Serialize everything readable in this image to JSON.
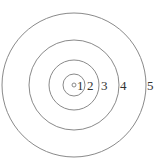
{
  "diagram": {
    "type": "concentric-circles",
    "center": [
      74,
      85
    ],
    "rings": [
      {
        "id": "1",
        "radius": 2
      },
      {
        "id": "2",
        "radius": 11
      },
      {
        "id": "3",
        "radius": 25
      },
      {
        "id": "4",
        "radius": 45
      },
      {
        "id": "5",
        "radius": 72
      }
    ],
    "labels": [
      {
        "text": "1",
        "x": 77,
        "y": 90
      },
      {
        "text": "2",
        "x": 87,
        "y": 90
      },
      {
        "text": "3",
        "x": 101,
        "y": 90
      },
      {
        "text": "4",
        "x": 120,
        "y": 90
      },
      {
        "text": "5",
        "x": 147,
        "y": 90
      }
    ],
    "stroke_color": "#8a8a8a"
  }
}
